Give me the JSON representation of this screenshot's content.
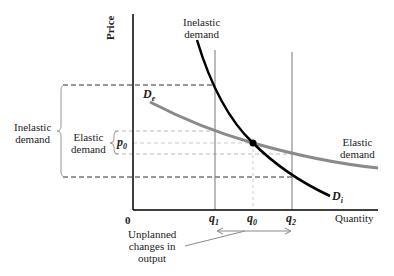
{
  "axes": {
    "y_label": "Price",
    "x_label": "Quantity",
    "origin": "0"
  },
  "curves": {
    "inelastic": {
      "label": "D",
      "subscript": "i",
      "top_label_line1": "Inelastic",
      "top_label_line2": "demand",
      "color": "#000000"
    },
    "elastic": {
      "label": "D",
      "subscript": "e",
      "right_label_line1": "Elastic",
      "right_label_line2": "demand",
      "color": "#8a8a8a"
    }
  },
  "price_marker": {
    "label": "p",
    "subscript": "0"
  },
  "x_ticks": [
    {
      "label": "q",
      "subscript": "1"
    },
    {
      "label": "q",
      "subscript": "0"
    },
    {
      "label": "q",
      "subscript": "2"
    }
  ],
  "braces": {
    "inelastic_line1": "Inelastic",
    "inelastic_line2": "demand",
    "elastic_line1": "Elastic",
    "elastic_line2": "demand"
  },
  "annotation": {
    "line1": "Unplanned",
    "line2": "changes in",
    "line3": "output"
  }
}
